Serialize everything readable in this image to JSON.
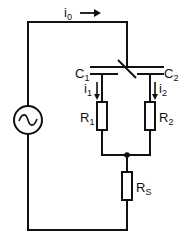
{
  "diagram": {
    "type": "circuit",
    "labels": {
      "i0": {
        "main": "i",
        "sub": "0"
      },
      "C1": {
        "main": "C",
        "sub": "1"
      },
      "C2": {
        "main": "C",
        "sub": "2"
      },
      "i1": {
        "main": "i",
        "sub": "1"
      },
      "i2": {
        "main": "i",
        "sub": "2"
      },
      "R1": {
        "main": "R",
        "sub": "1"
      },
      "R2": {
        "main": "R",
        "sub": "2"
      },
      "Rs": {
        "main": "R",
        "sub": "S"
      }
    },
    "components": [
      "AC source",
      "differential capacitor C1/C2",
      "R1",
      "R2",
      "RS"
    ],
    "colors": {
      "line": "#111111",
      "background": "#ffffff"
    }
  }
}
